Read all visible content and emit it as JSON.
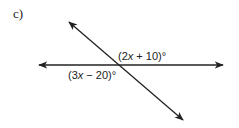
{
  "problem_label": "c)",
  "diagram": {
    "lines": [
      {
        "name": "horizontal-line",
        "arrows": "both"
      },
      {
        "name": "transversal-line",
        "arrows": "both"
      }
    ],
    "angles": [
      {
        "name": "upper-right-angle",
        "expression_parts": [
          "(2",
          "x",
          " + 10)°"
        ]
      },
      {
        "name": "lower-left-angle",
        "expression_parts": [
          "(3",
          "x",
          " − 20)°"
        ]
      }
    ]
  }
}
